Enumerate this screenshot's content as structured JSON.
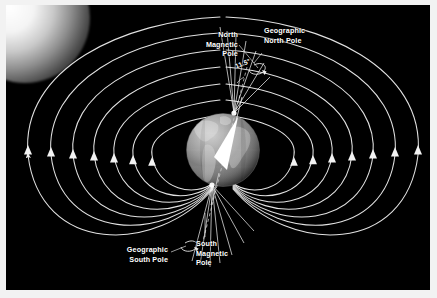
{
  "figure": {
    "background_color": "#000000",
    "frame_color": "#f2f2f2",
    "field_line_color": "#e8e8e8",
    "label_color": "#ffffff"
  },
  "labels": {
    "north_magnetic_pole": "North\nMagnetic\nPole",
    "geographic_north_pole": "Geographic\nNorth Pole",
    "tilt_angle": "11.5°",
    "geographic_south_pole": "Geographic\nSouth Pole",
    "south_magnetic_pole": "South\nMagnetic\nPole"
  },
  "scene": {
    "globe_label": "earth-globe",
    "sun_glow_label": "corner-glow",
    "magnetic_axis_label": "magnetic-axis-arrow",
    "rotation_axis_label": "rotation-axis-line",
    "field_line_count": 7,
    "arrow_direction": "upward"
  }
}
